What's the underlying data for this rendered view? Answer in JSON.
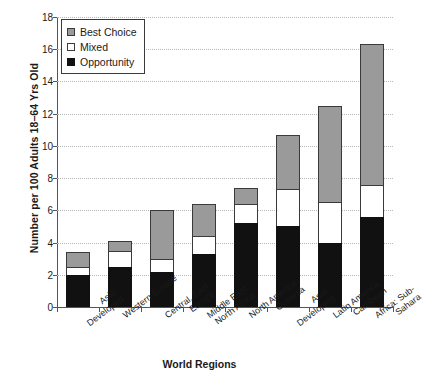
{
  "chart_data": {
    "type": "bar",
    "stacked": true,
    "title": "",
    "xlabel": "World Regions",
    "ylabel": "Number per 100 Adults 18–64 Yrs Old",
    "ylim": [
      0,
      18
    ],
    "ytick_step": 2,
    "yticks": [
      "18",
      "16",
      "14",
      "12",
      "10",
      "8",
      "6",
      "4",
      "2",
      "0"
    ],
    "grid": "horizontal-dotted",
    "legend_position": "top-left",
    "categories": [
      "Asia: Developed",
      "Western Europe",
      "Central, East Europe",
      "Middle East, North Africa",
      "North America, Oceania",
      "Asia: Developing",
      "Latin America, Carribean",
      "Africa: Sub-Sahara"
    ],
    "category_lines": [
      [
        "Asia:",
        "Developed"
      ],
      [
        "Western Europe"
      ],
      [
        "Central, East",
        "Europe"
      ],
      [
        "Middle East,",
        "North Africa"
      ],
      [
        "North America,",
        "Oceania"
      ],
      [
        "Asia:",
        "Developing"
      ],
      [
        "Latin America,",
        "Carribean"
      ],
      [
        "Africa: Sub-",
        "Sahara"
      ]
    ],
    "series": [
      {
        "name": "Opportunity",
        "color": "#111111",
        "values": [
          2.0,
          2.5,
          2.2,
          3.3,
          5.2,
          5.0,
          4.0,
          5.6
        ]
      },
      {
        "name": "Mixed",
        "color": "#ffffff",
        "values": [
          0.5,
          1.0,
          0.8,
          1.1,
          1.2,
          2.3,
          2.5,
          2.0
        ]
      },
      {
        "name": "Best Choice",
        "color": "#9a9a9a",
        "values": [
          0.9,
          0.6,
          3.0,
          2.0,
          1.0,
          3.4,
          6.0,
          8.7
        ]
      }
    ],
    "totals": [
      3.4,
      4.1,
      6.0,
      6.4,
      7.4,
      10.7,
      12.5,
      16.3
    ]
  },
  "legend": {
    "items": [
      {
        "label": "Best Choice",
        "swatch": "gray"
      },
      {
        "label": "Mixed",
        "swatch": "white"
      },
      {
        "label": "Opportunity",
        "swatch": "black"
      }
    ]
  }
}
